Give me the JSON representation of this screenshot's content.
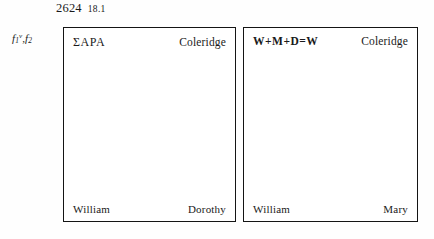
{
  "running_head": {
    "page_number": "2624",
    "section_number": "18.1"
  },
  "folio_label": {
    "first_folio_letter": "f",
    "first_folio_number": "1",
    "first_folio_side": "v",
    "separator": ",",
    "second_folio_letter": "f",
    "second_folio_number": "2",
    "full_text": "f1v,f2"
  },
  "diagrams": [
    {
      "id": "box-left",
      "top_left": "ΣAPA",
      "top_right": "Coleridge",
      "bottom_left": "William",
      "bottom_right": "Dorothy"
    },
    {
      "id": "box-right",
      "top_left": "W+M+D=W",
      "top_right": "Coleridge",
      "bottom_left": "William",
      "bottom_right": "Mary"
    }
  ],
  "colors": {
    "ink": "#141414",
    "paper": "#fefefe",
    "border": "#141414"
  }
}
